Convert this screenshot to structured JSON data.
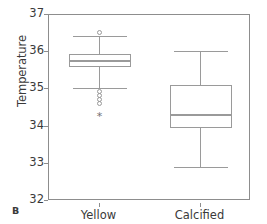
{
  "panel": {
    "letter": "B"
  },
  "chart_data": {
    "type": "box",
    "title": "",
    "xlabel": "",
    "ylabel": "Temperature",
    "ylim": [
      32,
      37
    ],
    "yticks": [
      32,
      33,
      34,
      35,
      36,
      37
    ],
    "ytick_labels": [
      "32",
      "33",
      "34",
      "35",
      "36",
      "37"
    ],
    "grid": false,
    "legend": "none",
    "categories": [
      "Yellow",
      "Calcified"
    ],
    "boxes": [
      {
        "name": "Yellow",
        "whisker_low": 35.05,
        "q1": 35.6,
        "median": 35.78,
        "q3": 35.95,
        "whisker_high": 36.43,
        "outliers": [
          36.52,
          34.95,
          34.83,
          34.73,
          34.63
        ],
        "extreme_outliers": [
          34.25
        ]
      },
      {
        "name": "Calcified",
        "whisker_low": 32.92,
        "q1": 33.95,
        "median": 34.33,
        "q3": 35.12,
        "whisker_high": 36.03,
        "outliers": [],
        "extreme_outliers": []
      }
    ],
    "colors": {
      "line": "#9a9a9a",
      "frame": "#8d8d8d",
      "text": "#3a3a3a",
      "background": "#ffffff"
    }
  }
}
